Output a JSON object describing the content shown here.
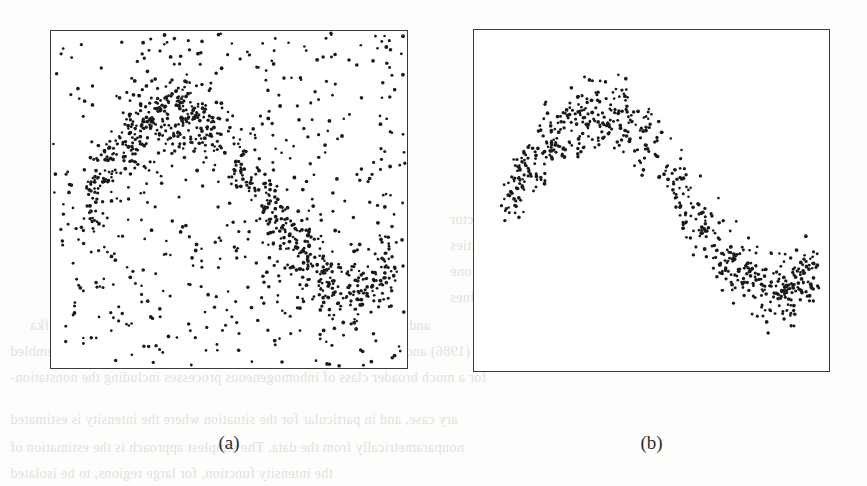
{
  "figure": {
    "background_color": "#fdfdfc",
    "frame_color": "#3a3a3a",
    "point_color": "#1a1a1a"
  },
  "panels": [
    {
      "id": "panel-a",
      "caption": "(a)",
      "frame": {
        "x": 50,
        "y": 30,
        "width": 358,
        "height": 339
      }
    },
    {
      "id": "panel-b",
      "caption": "(b)",
      "frame": {
        "x": 473,
        "y": 29,
        "width": 357,
        "height": 343
      }
    }
  ],
  "bleed_through_text": [
    {
      "text": "1.1 Introduction",
      "x": 690,
      "y": 176,
      "size": 17,
      "head": true
    },
    {
      "text": "the following. Consider a random vector",
      "x": 450,
      "y": 212,
      "size": 14,
      "head": false
    },
    {
      "text": "of a mixture of the densities",
      "x": 450,
      "y": 238,
      "size": 14,
      "head": false
    },
    {
      "text": "the mixture proportions sum to one",
      "x": 450,
      "y": 264,
      "size": 14,
      "head": false
    },
    {
      "text": "is a random variable taking values",
      "x": 450,
      "y": 290,
      "size": 14,
      "head": false
    },
    {
      "text": "and Wand (1994), MacGibbon and Brown (1988), Brass and Kafka",
      "x": 30,
      "y": 318,
      "size": 14,
      "head": false
    },
    {
      "text": "(1986) and Liebscher and Kulik (1997).  This template can also be assembled",
      "x": 10,
      "y": 344,
      "size": 14,
      "head": false
    },
    {
      "text": "for a much broader class of inhomogeneous processes including the nonstation-",
      "x": 10,
      "y": 370,
      "size": 14,
      "head": false
    },
    {
      "text": "ary case, and in particular for the situation where the intensity is estimated",
      "x": 10,
      "y": 412,
      "size": 14,
      "head": false
    },
    {
      "text": "nonparametrically from the data.  The simplest approach is the estimation of",
      "x": 10,
      "y": 440,
      "size": 14,
      "head": false
    },
    {
      "text": "the intensity function, for large regions, to be isolated",
      "x": 10,
      "y": 466,
      "size": 14,
      "head": false
    }
  ],
  "chart_data": [
    {
      "type": "scatter",
      "panel": "a",
      "title": "(a)",
      "description": "S-shaped (sinusoidal) band of clustered points superimposed on uniform background noise across the whole unit square",
      "xlabel": "",
      "ylabel": "",
      "xlim": [
        0,
        1
      ],
      "ylim": [
        0,
        1
      ],
      "grid": false,
      "legend": null,
      "n_points_total": 1000,
      "series": [
        {
          "name": "signal-cluster",
          "n_points": 450,
          "shape": "sine",
          "curve": {
            "amplitude": 0.26,
            "phase": 0.0,
            "frequency": 1.0,
            "offset": 0.5
          },
          "band_width": 0.13
        },
        {
          "name": "uniform-noise",
          "n_points": 550,
          "shape": "uniform",
          "bounds": [
            0,
            1,
            0,
            1
          ]
        }
      ]
    },
    {
      "type": "scatter",
      "panel": "b",
      "title": "(b)",
      "description": "The same S-shaped (sinusoidal) band of clustered points with the uniform background noise removed, occupying the upper-left to lower-right sweep of the frame",
      "xlabel": "",
      "ylabel": "",
      "xlim": [
        0,
        1
      ],
      "ylim": [
        0,
        1
      ],
      "grid": false,
      "legend": null,
      "n_points_total": 450,
      "series": [
        {
          "name": "signal-cluster",
          "n_points": 450,
          "shape": "sine",
          "curve": {
            "amplitude": 0.26,
            "phase": 0.0,
            "frequency": 1.0,
            "offset": 0.5
          },
          "band_width": 0.13
        }
      ]
    }
  ]
}
